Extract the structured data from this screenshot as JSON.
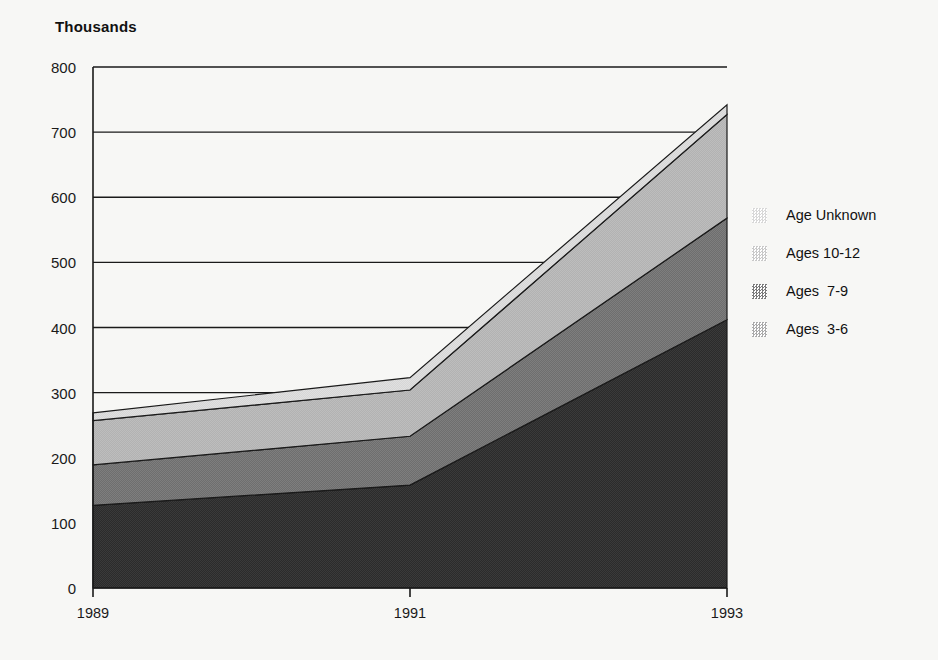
{
  "chart_data": {
    "type": "area",
    "stacked": true,
    "title": "",
    "ylabel": "Thousands",
    "xlabel": "",
    "x": [
      1989,
      1991,
      1993
    ],
    "xtick_labels": [
      "1989",
      "1991",
      "1993"
    ],
    "ylim": [
      0,
      800
    ],
    "yticks": [
      0,
      100,
      200,
      300,
      400,
      500,
      600,
      700,
      800
    ],
    "ytick_labels": [
      "0",
      "100",
      "200",
      "300",
      "400",
      "500",
      "600",
      "700",
      "800"
    ],
    "grid": "horizontal",
    "legend_position": "right",
    "series": [
      {
        "name": "Ages  3-6",
        "values": [
          127,
          158,
          412
        ],
        "color": "#2e2e2e"
      },
      {
        "name": "Ages  7-9",
        "values": [
          62,
          75,
          156
        ],
        "color": "#6f6f6f"
      },
      {
        "name": "Ages 10-12",
        "values": [
          68,
          71,
          159
        ],
        "color": "#b4b4b4"
      },
      {
        "name": "Age Unknown",
        "values": [
          12,
          19,
          15
        ],
        "color": "#d8d8d8"
      }
    ],
    "cumulative": {
      "Ages  3-6": [
        127,
        158,
        412
      ],
      "Ages  7-9": [
        189,
        233,
        568
      ],
      "Ages 10-12": [
        257,
        304,
        727
      ],
      "Age Unknown": [
        269,
        323,
        742
      ]
    },
    "totals": [
      269,
      323,
      742
    ]
  },
  "axis_title": "Thousands",
  "legend": {
    "items": [
      {
        "label": "Age Unknown",
        "color": "#d8d8d8"
      },
      {
        "label": "Ages 10-12",
        "color": "#c9c9c9"
      },
      {
        "label": "Ages  7-9",
        "color": "#7a7a7a"
      },
      {
        "label": "Ages  3-6",
        "color": "#aaaaaa"
      }
    ]
  },
  "colors": {
    "background": "#f7f7f5",
    "axis": "#1a1a1a",
    "grid": "#1a1a1a",
    "band_3_6": "#2e2e2e",
    "band_7_9": "#6f6f6f",
    "band_10_12": "#b4b4b4",
    "band_unknown": "#d8d8d8"
  }
}
